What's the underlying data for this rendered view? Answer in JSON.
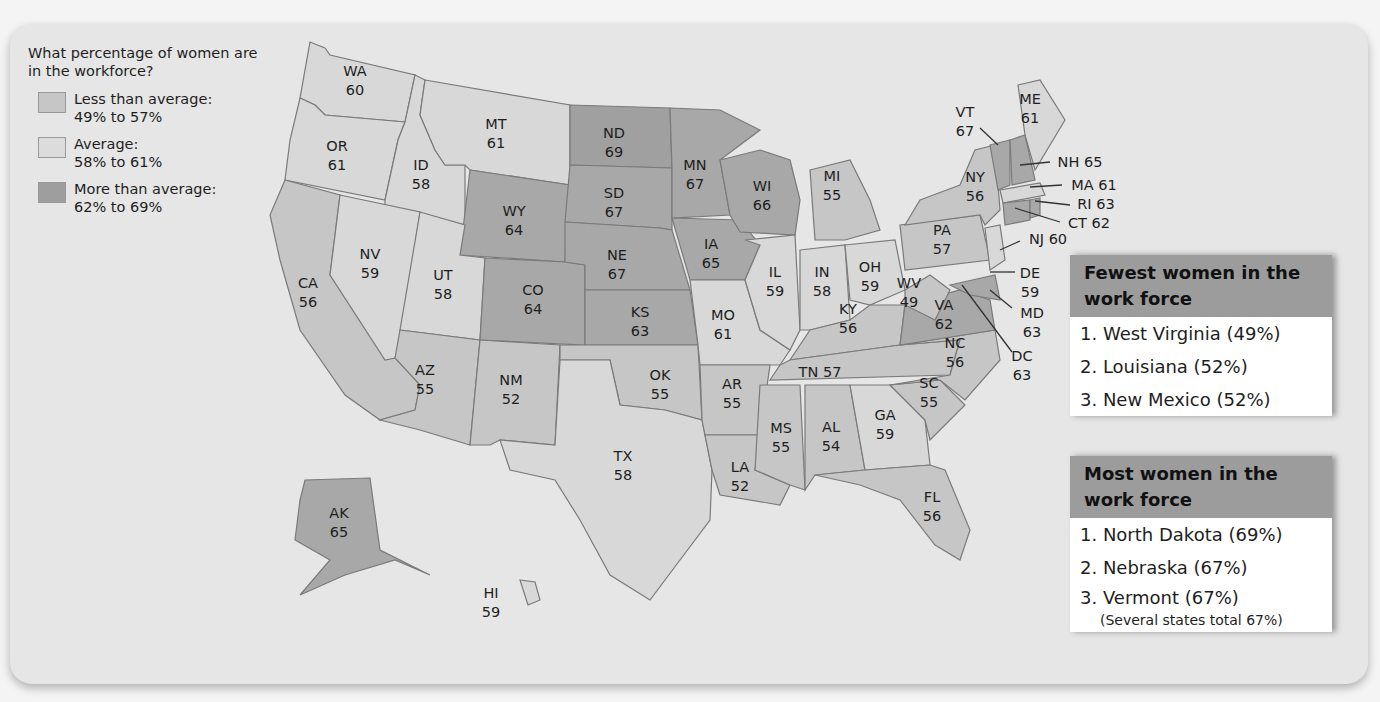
{
  "legend": {
    "title": "What percentage of women are in the workforce?",
    "items": [
      {
        "label": "Less than average:",
        "range": "49% to 57%",
        "color": "#c6c6c6"
      },
      {
        "label": "Average:",
        "range": "58% to 61%",
        "color": "#d8d8d8"
      },
      {
        "label": "More than average:",
        "range": "62% to 69%",
        "color": "#9e9e9e"
      }
    ]
  },
  "states": {
    "WA": {
      "abbr": "WA",
      "value": "60"
    },
    "OR": {
      "abbr": "OR",
      "value": "61"
    },
    "CA": {
      "abbr": "CA",
      "value": "56"
    },
    "ID": {
      "abbr": "ID",
      "value": "58"
    },
    "NV": {
      "abbr": "NV",
      "value": "59"
    },
    "MT": {
      "abbr": "MT",
      "value": "61"
    },
    "WY": {
      "abbr": "WY",
      "value": "64"
    },
    "UT": {
      "abbr": "UT",
      "value": "58"
    },
    "CO": {
      "abbr": "CO",
      "value": "64"
    },
    "AZ": {
      "abbr": "AZ",
      "value": "55"
    },
    "NM": {
      "abbr": "NM",
      "value": "52"
    },
    "ND": {
      "abbr": "ND",
      "value": "69"
    },
    "SD": {
      "abbr": "SD",
      "value": "67"
    },
    "NE": {
      "abbr": "NE",
      "value": "67"
    },
    "KS": {
      "abbr": "KS",
      "value": "63"
    },
    "OK": {
      "abbr": "OK",
      "value": "55"
    },
    "TX": {
      "abbr": "TX",
      "value": "58"
    },
    "MN": {
      "abbr": "MN",
      "value": "67"
    },
    "IA": {
      "abbr": "IA",
      "value": "65"
    },
    "MO": {
      "abbr": "MO",
      "value": "61"
    },
    "AR": {
      "abbr": "AR",
      "value": "55"
    },
    "LA": {
      "abbr": "LA",
      "value": "52"
    },
    "WI": {
      "abbr": "WI",
      "value": "66"
    },
    "IL": {
      "abbr": "IL",
      "value": "59"
    },
    "MI": {
      "abbr": "MI",
      "value": "55"
    },
    "IN": {
      "abbr": "IN",
      "value": "58"
    },
    "OH": {
      "abbr": "OH",
      "value": "59"
    },
    "KY": {
      "abbr": "KY",
      "value": "56"
    },
    "TN": {
      "abbr": "TN",
      "value": "57"
    },
    "MS": {
      "abbr": "MS",
      "value": "55"
    },
    "AL": {
      "abbr": "AL",
      "value": "54"
    },
    "GA": {
      "abbr": "GA",
      "value": "59"
    },
    "FL": {
      "abbr": "FL",
      "value": "56"
    },
    "SC": {
      "abbr": "SC",
      "value": "55"
    },
    "NC": {
      "abbr": "NC",
      "value": "56"
    },
    "VA": {
      "abbr": "VA",
      "value": "62"
    },
    "WV": {
      "abbr": "WV",
      "value": "49"
    },
    "PA": {
      "abbr": "PA",
      "value": "57"
    },
    "NY": {
      "abbr": "NY",
      "value": "56"
    },
    "VT": {
      "abbr": "VT",
      "value": "67"
    },
    "ME": {
      "abbr": "ME",
      "value": "61"
    },
    "NH": {
      "abbr": "NH",
      "value": "65"
    },
    "MA": {
      "abbr": "MA",
      "value": "61"
    },
    "RI": {
      "abbr": "RI",
      "value": "63"
    },
    "CT": {
      "abbr": "CT",
      "value": "62"
    },
    "NJ": {
      "abbr": "NJ",
      "value": "60"
    },
    "DE": {
      "abbr": "DE",
      "value": "59"
    },
    "MD": {
      "abbr": "MD",
      "value": "63"
    },
    "DC": {
      "abbr": "DC",
      "value": "63"
    },
    "AK": {
      "abbr": "AK",
      "value": "65"
    },
    "HI": {
      "abbr": "HI",
      "value": "59"
    }
  },
  "fewest": {
    "title": "Fewest women in the work force",
    "items": [
      "1. West Virginia (49%)",
      "2. Louisiana (52%)",
      "3. New Mexico (52%)"
    ]
  },
  "most": {
    "title": "Most women in the work force",
    "items": [
      "1. North Dakota (69%)",
      "2. Nebraska (67%)",
      "3. Vermont  (67%)"
    ],
    "note": "(Several states total 67%)"
  }
}
